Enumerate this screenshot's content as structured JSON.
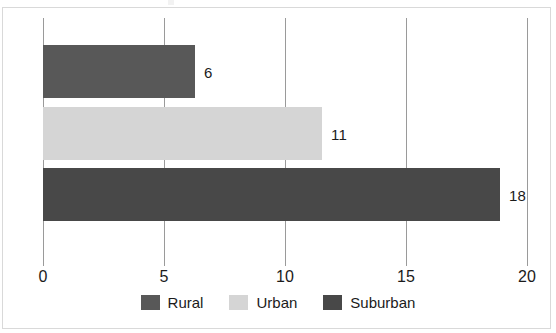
{
  "chart_data": {
    "type": "bar",
    "orientation": "horizontal",
    "title": "",
    "subtitle": "",
    "xlabel": "",
    "ylabel": "",
    "categories": [
      "Rural",
      "Urban",
      "Suburban"
    ],
    "values": [
      6,
      11,
      18
    ],
    "data_labels": [
      "6",
      "11",
      "18"
    ],
    "xlim": [
      0,
      20
    ],
    "xticks": [
      0,
      5,
      10,
      15,
      20
    ],
    "xtick_labels": [
      "0",
      "5",
      "10",
      "15",
      "20"
    ],
    "grid": "vertical",
    "legend_position": "bottom",
    "series": [
      {
        "name": "Rural",
        "value": 6,
        "label": "6",
        "color": "#585858"
      },
      {
        "name": "Urban",
        "value": 11,
        "label": "11",
        "color": "#d5d5d5"
      },
      {
        "name": "Suburban",
        "value": 18,
        "label": "18",
        "color": "#484848"
      }
    ]
  },
  "legend": {
    "items": [
      {
        "label": "Rural",
        "color": "#585858"
      },
      {
        "label": "Urban",
        "color": "#d5d5d5"
      },
      {
        "label": "Suburban",
        "color": "#484848"
      }
    ]
  },
  "axis": {
    "ticks": [
      {
        "label": "0",
        "value": 0
      },
      {
        "label": "5",
        "value": 5
      },
      {
        "label": "10",
        "value": 10
      },
      {
        "label": "15",
        "value": 15
      },
      {
        "label": "20",
        "value": 20
      }
    ]
  },
  "colors": {
    "frame": "#d9d9d9",
    "gridline": "#9a9a9a",
    "text": "#1b1b1b",
    "background": "#ffffff"
  }
}
